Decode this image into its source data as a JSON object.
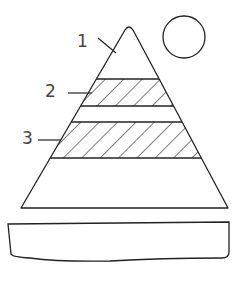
{
  "diagram": {
    "type": "layered-pyramid",
    "labels": [
      {
        "id": "1",
        "text": "1",
        "target": "apex-region"
      },
      {
        "id": "2",
        "text": "2",
        "target": "upper-hatched-band"
      },
      {
        "id": "3",
        "text": "3",
        "target": "lower-hatched-band"
      }
    ],
    "elements": {
      "circle": "sun-or-moon",
      "pyramid": "triangle with two hatched bands",
      "base": "rectangular slab below pyramid"
    },
    "colors": {
      "stroke": "#222222",
      "label": "#444444",
      "background": "#ffffff"
    }
  }
}
